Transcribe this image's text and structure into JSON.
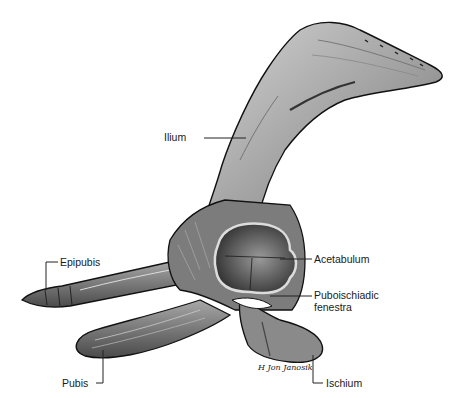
{
  "figure": {
    "signature": "H. Jon Janosik"
  },
  "labels": {
    "ilium": "Ilium",
    "acetabulum": "Acetabulum",
    "fenestra_line1": "Puboischiadic",
    "fenestra_line2": "fenestra",
    "epipubis": "Epipubis",
    "pubis": "Pubis",
    "ischium": "Ischium"
  },
  "colors": {
    "background": "#ffffff",
    "bone_light": "#c8c8c8",
    "bone_mid": "#8a8a8a",
    "bone_dark": "#3a3a3a",
    "outline": "#111111",
    "leader_line": "#222222"
  }
}
